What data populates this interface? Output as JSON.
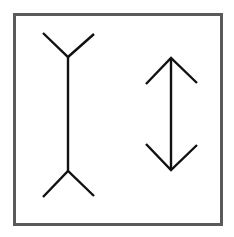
{
  "diagram": {
    "colors": {
      "frame": "#5a5a5a",
      "line": "#111111",
      "background": "#ffffff"
    },
    "frame": {
      "x": 14,
      "y": 14,
      "width": 208,
      "height": 211
    },
    "figures": [
      {
        "name": "fins-out-line",
        "shaft": {
          "x": 68,
          "y1": 57,
          "y2": 171
        },
        "top_fins": [
          [
            43,
            33
          ],
          [
            68,
            57
          ],
          [
            94,
            34
          ]
        ],
        "bottom_fins": [
          [
            43,
            197
          ],
          [
            68,
            171
          ],
          [
            94,
            196
          ]
        ]
      },
      {
        "name": "arrowheads-line",
        "shaft": {
          "x": 171,
          "y1": 58,
          "y2": 170
        },
        "top_head": [
          [
            146,
            84
          ],
          [
            171,
            58
          ],
          [
            197,
            83
          ]
        ],
        "bottom_head": [
          [
            146,
            144
          ],
          [
            171,
            170
          ],
          [
            197,
            145
          ]
        ]
      }
    ]
  }
}
